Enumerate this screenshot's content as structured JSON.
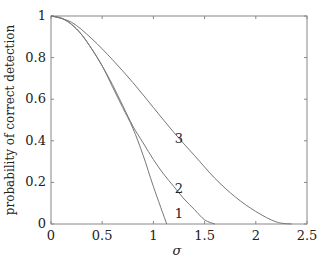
{
  "chart_data": {
    "type": "line",
    "title": "",
    "xlabel": "σ",
    "ylabel": "probability of correct detection",
    "xlim": [
      0,
      2.5
    ],
    "ylim": [
      0,
      1
    ],
    "xticks": [
      "0",
      "0.5",
      "1",
      "1.5",
      "2",
      "2.5"
    ],
    "yticks": [
      "0",
      "0.2",
      "0.4",
      "0.6",
      "0.8",
      "1"
    ],
    "grid": false,
    "legend": "none (curves labeled inline)",
    "series": [
      {
        "name": "1",
        "x": [
          0,
          0.1,
          0.2,
          0.3,
          0.4,
          0.5,
          0.6,
          0.7,
          0.8,
          0.9,
          1.0,
          1.13
        ],
        "values": [
          1.0,
          0.99,
          0.96,
          0.91,
          0.84,
          0.76,
          0.66,
          0.56,
          0.46,
          0.33,
          0.18,
          0.0
        ]
      },
      {
        "name": "2",
        "x": [
          0,
          0.1,
          0.2,
          0.3,
          0.4,
          0.5,
          0.6,
          0.7,
          0.8,
          0.9,
          1.0,
          1.1,
          1.2,
          1.3,
          1.4,
          1.5,
          1.6
        ],
        "values": [
          1.0,
          0.99,
          0.96,
          0.91,
          0.84,
          0.76,
          0.67,
          0.57,
          0.47,
          0.39,
          0.31,
          0.24,
          0.18,
          0.12,
          0.07,
          0.02,
          0.0
        ]
      },
      {
        "name": "3",
        "x": [
          0,
          0.2,
          0.4,
          0.6,
          0.8,
          1.0,
          1.2,
          1.4,
          1.6,
          1.8,
          2.0,
          2.2,
          2.35
        ],
        "values": [
          1.0,
          0.97,
          0.89,
          0.79,
          0.68,
          0.56,
          0.44,
          0.33,
          0.22,
          0.13,
          0.06,
          0.01,
          0.0
        ]
      }
    ],
    "annotations": [
      {
        "text": "1",
        "x": 1.25,
        "y": 0.05
      },
      {
        "text": "2",
        "x": 1.25,
        "y": 0.17
      },
      {
        "text": "3",
        "x": 1.25,
        "y": 0.41
      }
    ]
  }
}
